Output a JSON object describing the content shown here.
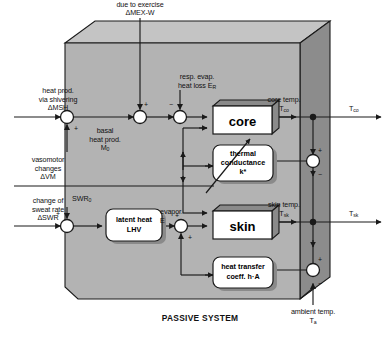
{
  "figure": {
    "caption": "PASSIVE SYSTEM",
    "domain": "thermoregulation block diagram"
  },
  "colors": {
    "panel_face": "#b3b3b3",
    "panel_side": "#8c8c8c",
    "panel_top": "#c4c4c4",
    "block_fill": "#ffffff",
    "block_shadow": "#8a8a8a",
    "line": "#1a1a1a",
    "text": "#111111",
    "page_bg": "#ffffff"
  },
  "inputs": {
    "shivering": {
      "line1": "heat prod.",
      "line2": "via shivering",
      "line3": "ΔMSH"
    },
    "exercise": {
      "line1": "heat prod.",
      "line2": "due to exercise",
      "line3": "ΔMEX-W"
    },
    "resp_evap": {
      "line1": "resp. evap.",
      "line2": "heat loss E"
    },
    "resp_evap_sub": "R",
    "basal": {
      "line1": "basal",
      "line2": "heat prod.",
      "line3": "M"
    },
    "basal_sub": "0",
    "vasomotor": {
      "line1": "vasomotor",
      "line2": "changes",
      "line3": "ΔVM"
    },
    "sweat": {
      "line1": "change of",
      "line2": "sweat rate",
      "line3": "ΔSWR"
    },
    "swr0": "SWR",
    "swr0_sub": "0",
    "ambient": {
      "line1": "ambient temp.",
      "line2": "T"
    },
    "ambient_sub": "a"
  },
  "blocks": {
    "core": {
      "label": "core"
    },
    "skin": {
      "label": "skin"
    },
    "thermal_conductance": {
      "line1": "thermal",
      "line2": "conductance",
      "line3": "k*"
    },
    "latent_heat": {
      "line1": "latent heat",
      "line2": "LHV"
    },
    "heat_transfer": {
      "line1": "heat transfer",
      "line2": "coeff. h·A"
    }
  },
  "signals": {
    "evapor": {
      "line1": "evapor.",
      "line2": "E"
    },
    "core_temp": {
      "line1": "core temp.",
      "line2": "T"
    },
    "core_temp_sub": "co",
    "skin_temp": {
      "line1": "skin temp.",
      "line2": "T"
    },
    "skin_temp_sub": "sk"
  },
  "outputs": {
    "t_co": "T",
    "t_co_sub": "co",
    "t_sk": "T",
    "t_sk_sub": "sk"
  },
  "signs": {
    "plus": "+",
    "minus": "−"
  }
}
